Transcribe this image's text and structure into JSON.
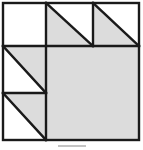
{
  "figure": {
    "title": "Geometric tiling figure",
    "canvas": {
      "width": 143,
      "height": 150
    },
    "colors": {
      "background": "#ffffff",
      "fill_shaded": "#dcdcdc",
      "fill_blank": "#ffffff",
      "stroke": "#1a1a1a",
      "caption_sliver": "#b9b9b9"
    },
    "stroke_width_outer": 2.4,
    "stroke_width_inner": 2.4,
    "outer_square": {
      "x": 3,
      "y": 3,
      "width": 136,
      "height": 137,
      "label": "outer-border-square"
    },
    "grid_lines": [
      {
        "name": "vertical-divider-main",
        "x1": 46,
        "y1": 3,
        "x2": 46,
        "y2": 140
      },
      {
        "name": "horizontal-divider-main",
        "x1": 3,
        "y1": 46,
        "x2": 139,
        "y2": 46
      },
      {
        "name": "vertical-divider-top",
        "x1": 93,
        "y1": 3,
        "x2": 93,
        "y2": 46
      },
      {
        "name": "horizontal-divider-left",
        "x1": 3,
        "y1": 93,
        "x2": 46,
        "y2": 93
      }
    ],
    "cells": [
      {
        "name": "cell-top-left-blank",
        "kind": "square",
        "fill": "blank",
        "points": "3,3 46,3 46,46 3,46",
        "note": "empty white square, upper left"
      },
      {
        "name": "cell-top-middle-triangle",
        "kind": "right-triangle",
        "fill": "shaded",
        "right_angle_corner": "top-left",
        "points": "46,3 46,46 93,46",
        "hypotenuse": "top-left to bottom-right"
      },
      {
        "name": "cell-top-right-triangle",
        "kind": "right-triangle",
        "fill": "shaded",
        "right_angle_corner": "top-left",
        "points": "93,3 93,46 139,46",
        "hypotenuse": "top-left to bottom-right"
      },
      {
        "name": "cell-middle-left-triangle",
        "kind": "right-triangle",
        "fill": "shaded",
        "right_angle_corner": "top-right",
        "points": "3,46 46,46 46,93",
        "hypotenuse": "top-left to bottom-right"
      },
      {
        "name": "cell-bottom-left-triangle",
        "kind": "right-triangle",
        "fill": "shaded",
        "right_angle_corner": "top-right",
        "points": "3,93 46,93 46,140",
        "hypotenuse": "top-left to bottom-right"
      },
      {
        "name": "cell-bottom-right-square",
        "kind": "square",
        "fill": "shaded",
        "points": "46,46 139,46 139,140 46,140",
        "note": "large shaded square occupying lower-right"
      }
    ],
    "hypotenuses": [
      {
        "name": "hypotenuse-top-middle",
        "x1": 46,
        "y1": 3,
        "x2": 93,
        "y2": 46
      },
      {
        "name": "hypotenuse-top-right",
        "x1": 93,
        "y1": 3,
        "x2": 139,
        "y2": 46
      },
      {
        "name": "hypotenuse-middle-left",
        "x1": 3,
        "y1": 46,
        "x2": 46,
        "y2": 93
      },
      {
        "name": "hypotenuse-bottom-left",
        "x1": 3,
        "y1": 93,
        "x2": 46,
        "y2": 140
      }
    ],
    "caption": {
      "visible_text": "",
      "note": "faint cropped sliver of a caption below the figure"
    }
  }
}
